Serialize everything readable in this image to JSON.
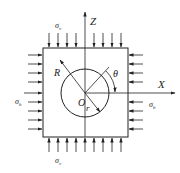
{
  "diagram": {
    "axes": {
      "z_label": "Z",
      "x_label": "X"
    },
    "labels": {
      "sigma_v_top": "σ",
      "sigma_v_top_sub": "v",
      "sigma_v_bottom": "σ",
      "sigma_v_bottom_sub": "v",
      "sigma_h_left": "σ",
      "sigma_h_left_sub": "h",
      "sigma_h_right": "σ",
      "sigma_h_right_sub": "h",
      "outer_radius": "R",
      "inner_radius": "r",
      "center": "O",
      "angle": "θ"
    },
    "colors": {
      "stroke": "#222222",
      "background": "#ffffff"
    }
  }
}
